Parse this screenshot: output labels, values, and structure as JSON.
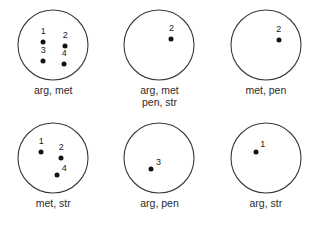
{
  "figure": {
    "type": "set-diagram-grid",
    "background_color": "#ffffff",
    "circle_stroke_color": "#3a3a3a",
    "point_color": "#121212",
    "text_color": "#2b2b2b",
    "rows": 2,
    "columns": 3
  },
  "panels": [
    {
      "id": "panel-1",
      "caption_lines": [
        "arg, met"
      ],
      "points": [
        {
          "label": "1",
          "cx": 26,
          "cy": 33,
          "lx": 26,
          "ly": 22
        },
        {
          "label": "2",
          "cx": 48,
          "cy": 37,
          "lx": 48,
          "ly": 26
        },
        {
          "label": "3",
          "cx": 26,
          "cy": 52,
          "lx": 26,
          "ly": 41
        },
        {
          "label": "4",
          "cx": 47,
          "cy": 55,
          "lx": 47,
          "ly": 44
        }
      ]
    },
    {
      "id": "panel-2",
      "caption_lines": [
        "arg, met",
        "pen, str"
      ],
      "points": [
        {
          "label": "2",
          "cx": 48,
          "cy": 30,
          "lx": 48,
          "ly": 19
        }
      ]
    },
    {
      "id": "panel-3",
      "caption_lines": [
        "met, pen"
      ],
      "points": [
        {
          "label": "2",
          "cx": 49,
          "cy": 31,
          "lx": 49,
          "ly": 20
        }
      ]
    },
    {
      "id": "panel-4",
      "caption_lines": [
        "met, str"
      ],
      "points": [
        {
          "label": "1",
          "cx": 24,
          "cy": 30,
          "lx": 24,
          "ly": 19
        },
        {
          "label": "2",
          "cx": 44,
          "cy": 36,
          "lx": 44,
          "ly": 25
        },
        {
          "label": "4",
          "cx": 40,
          "cy": 53,
          "lx": 47,
          "ly": 46
        }
      ]
    },
    {
      "id": "panel-5",
      "caption_lines": [
        "arg, pen"
      ],
      "points": [
        {
          "label": "3",
          "cx": 28,
          "cy": 47,
          "lx": 35,
          "ly": 40
        }
      ]
    },
    {
      "id": "panel-6",
      "caption_lines": [
        "arg, str"
      ],
      "points": [
        {
          "label": "1",
          "cx": 26,
          "cy": 30,
          "lx": 33,
          "ly": 22
        }
      ]
    }
  ]
}
